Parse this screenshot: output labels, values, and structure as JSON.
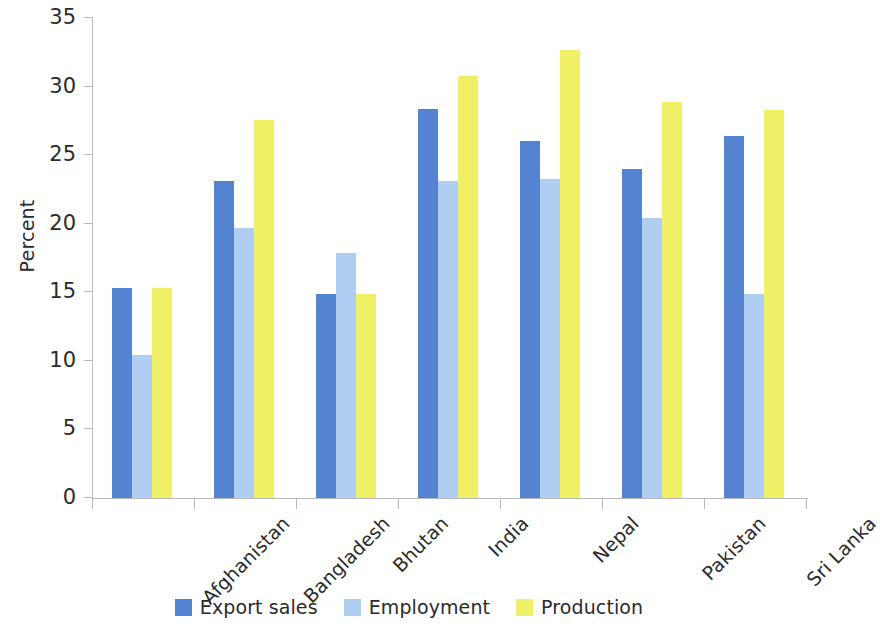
{
  "chart_data": {
    "type": "bar",
    "title": "",
    "xlabel": "",
    "ylabel": "Percent",
    "ylim": [
      0,
      35
    ],
    "yticks": [
      0,
      5,
      10,
      15,
      20,
      25,
      30,
      35
    ],
    "grid": false,
    "legend_position": "bottom",
    "categories": [
      "Afghanistan",
      "Bangladesh",
      "Bhutan",
      "India",
      "Nepal",
      "Pakistan",
      "Sri Lanka"
    ],
    "series": [
      {
        "name": "Export sales",
        "color": "#5484d1",
        "values": [
          15.3,
          23.1,
          14.9,
          28.4,
          26.0,
          24.0,
          26.4
        ]
      },
      {
        "name": "Employment",
        "color": "#b0cef2",
        "values": [
          10.4,
          19.7,
          17.9,
          23.1,
          23.3,
          20.4,
          14.9
        ]
      },
      {
        "name": "Production",
        "color": "#f0f066",
        "values": [
          15.3,
          27.6,
          14.9,
          30.8,
          32.7,
          28.9,
          28.3
        ]
      }
    ]
  },
  "axis": {
    "y_title": "Percent",
    "y_tick_labels": [
      "0",
      "5",
      "10",
      "15",
      "20",
      "25",
      "30",
      "35"
    ],
    "x_tick_labels": [
      "Afghanistan",
      "Bangladesh",
      "Bhutan",
      "India",
      "Nepal",
      "Pakistan",
      "Sri Lanka"
    ]
  },
  "legend": {
    "items": [
      {
        "label": "Export sales",
        "color": "#5484d1"
      },
      {
        "label": "Employment",
        "color": "#b0cef2"
      },
      {
        "label": "Production",
        "color": "#f0f066"
      }
    ]
  }
}
